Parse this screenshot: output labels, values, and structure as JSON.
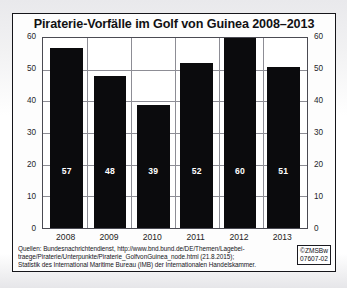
{
  "figure": {
    "title": "Piraterie-Vorfälle im Golf von Guinea 2008–2013"
  },
  "chart_data": {
    "type": "bar",
    "title": "Piraterie-Vorfälle im Golf von Guinea 2008–2013",
    "categories": [
      "2008",
      "2009",
      "2010",
      "2011",
      "2012",
      "2013"
    ],
    "values": [
      57,
      48,
      39,
      52,
      60,
      51
    ],
    "xlabel": "",
    "ylabel": "",
    "ylim": [
      0,
      60
    ],
    "yticks": [
      0,
      10,
      20,
      30,
      40,
      50,
      60
    ],
    "ytick_labels_left": [
      "60",
      "50",
      "40",
      "30",
      "20",
      "10",
      "0"
    ],
    "ytick_labels_right": [
      "60",
      "50",
      "40",
      "30",
      "20",
      "10",
      "0"
    ],
    "grid": "horizontal-and-vertical",
    "legend": "none",
    "bar_color": "#0b0b0d",
    "value_label_color": "#ffffff",
    "grid_color": "#8d8d95"
  },
  "source": {
    "line1": "Quellen: Bundesnachrichtendienst, http://www.bnd.bund.de/DE/Themen/Lagebei-",
    "line2": "traege/Piraterie/Unterpunkte/Piraterie_GolfvonGuinea_node.html (21.8.2015);",
    "line3": "Statistik des International Maritime Bureau (IMB) der Internationalen Handelskammer."
  },
  "stamp": {
    "line1": "©ZMSBw",
    "line2": "07607-02"
  }
}
